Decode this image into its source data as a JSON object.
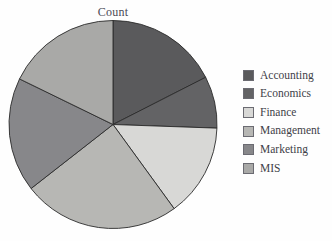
{
  "chart_data": {
    "type": "pie",
    "title": "Count",
    "xlabel": "",
    "ylabel": "",
    "legend_position": "right",
    "grid": false,
    "categories": [
      "Accounting",
      "Economics",
      "Finance",
      "Management",
      "Marketing",
      "MIS"
    ],
    "values": [
      17.5,
      8.1,
      14.4,
      24.4,
      17.8,
      17.8
    ],
    "start_angles_deg": [
      0,
      63,
      92,
      144,
      232,
      296
    ],
    "end_angles_deg": [
      63,
      92,
      144,
      232,
      296,
      360
    ],
    "colors": [
      "#5a5a5c",
      "#636365",
      "#d8d8d6",
      "#b7b7b4",
      "#87878a",
      "#a9a9a7"
    ],
    "slice_edge_color": "#2b2b2b"
  },
  "legend": {
    "items": [
      {
        "label": "Accounting",
        "color": "#5a5a5c"
      },
      {
        "label": "Economics",
        "color": "#636365"
      },
      {
        "label": "Finance",
        "color": "#d8d8d6"
      },
      {
        "label": "Management",
        "color": "#b7b7b4"
      },
      {
        "label": "Marketing",
        "color": "#87878a"
      },
      {
        "label": "MIS",
        "color": "#a9a9a7"
      }
    ]
  },
  "geometry": {
    "center_x": 113,
    "center_y": 124.5,
    "radius": 104
  }
}
